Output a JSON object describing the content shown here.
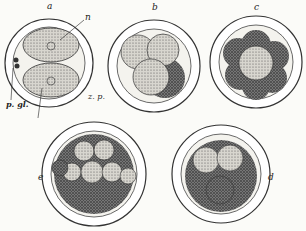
{
  "figure": {
    "panels": [
      {
        "id": "a",
        "label": "a",
        "stage": "two-cell"
      },
      {
        "id": "b",
        "label": "b",
        "stage": "four-cell"
      },
      {
        "id": "c",
        "label": "c",
        "stage": "multi-cell"
      },
      {
        "id": "d",
        "label": "d",
        "stage": "morula"
      },
      {
        "id": "e",
        "label": "e",
        "stage": "morula"
      }
    ],
    "annotations": {
      "n": "n",
      "pgl": "p. gl.",
      "zp": "z. p."
    }
  }
}
